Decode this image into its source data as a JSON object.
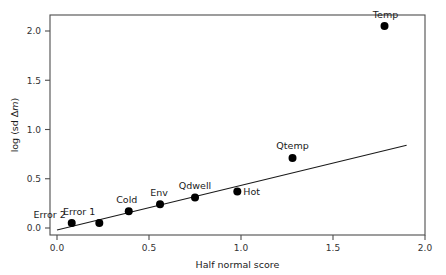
{
  "chart_data": {
    "type": "scatter",
    "title": "",
    "xlabel": "Half normal score",
    "ylabel": "log (sd Δm)",
    "ylabel_parts": {
      "prefix": "log (sd ",
      "delta": "Δ",
      "italic": "m",
      "suffix": ")"
    },
    "xlim": [
      0.0,
      2.05
    ],
    "ylim": [
      -0.05,
      2.18
    ],
    "xticks": [
      0.0,
      0.5,
      1.0,
      1.5,
      2.0
    ],
    "xtick_labels": [
      "0.0",
      "0.5",
      "1.0",
      "1.5",
      "2.0"
    ],
    "yticks": [
      0.0,
      0.5,
      1.0,
      1.5,
      2.0
    ],
    "ytick_labels": [
      "0.0",
      "0.5",
      "1.0",
      "1.5",
      "2.0"
    ],
    "grid": false,
    "legend": "none",
    "point_color": "#000000",
    "line_color": "#1a1a1a",
    "axis_color": "#4d4d4d",
    "points": [
      {
        "label": "Error 2",
        "x": 0.08,
        "y": 0.05,
        "label_dx": -6,
        "label_dy": -5,
        "anchor": "end"
      },
      {
        "label": "Error 1",
        "x": 0.23,
        "y": 0.05,
        "label_dx": -4,
        "label_dy": -8,
        "anchor": "end"
      },
      {
        "label": "Cold",
        "x": 0.39,
        "y": 0.17,
        "label_dx": -2,
        "label_dy": -8,
        "anchor": "middle"
      },
      {
        "label": "Env",
        "x": 0.56,
        "y": 0.24,
        "label_dx": -1,
        "label_dy": -8,
        "anchor": "middle"
      },
      {
        "label": "Qdwell",
        "x": 0.75,
        "y": 0.31,
        "label_dx": 0,
        "label_dy": -8,
        "anchor": "middle"
      },
      {
        "label": "Hot",
        "x": 0.98,
        "y": 0.37,
        "label_dx": 6,
        "label_dy": 3,
        "anchor": "start"
      },
      {
        "label": "Qtemp",
        "x": 1.28,
        "y": 0.71,
        "label_dx": 0,
        "label_dy": -9,
        "anchor": "middle"
      },
      {
        "label": "Temp",
        "x": 1.78,
        "y": 2.05,
        "label_dx": 1,
        "label_dy": -8,
        "anchor": "middle"
      }
    ],
    "fit_line": {
      "x_start": 0.0,
      "y_start": -0.02,
      "x_end": 1.9,
      "y_end": 0.84
    }
  }
}
